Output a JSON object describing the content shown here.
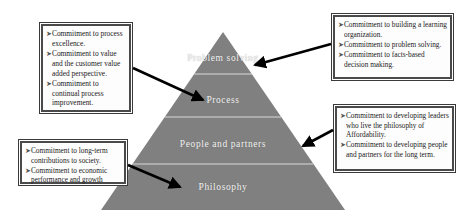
{
  "diagram": {
    "pyramid": {
      "fill_color": "#808080",
      "divider_color": "#d9d9d9",
      "label_color": "#f2f2f2",
      "tiers": [
        {
          "id": "problem-solving",
          "label": "Problem solving"
        },
        {
          "id": "process",
          "label": "Process"
        },
        {
          "id": "people-and-partners",
          "label": "People and partners"
        },
        {
          "id": "philosophy",
          "label": "Philosophy"
        }
      ]
    },
    "arrow_color": "#000000",
    "box_border_color": "#4a4a4a",
    "bullet_marker": "➤",
    "callouts": [
      {
        "id": "process-excellence",
        "target_tier": "process",
        "bullets": [
          "Commitment to process excellence.",
          "Commitment to value and the customer value added perspective.",
          "Commitment to continual process improvement."
        ]
      },
      {
        "id": "learning-organization",
        "target_tier": "problem-solving",
        "bullets": [
          "Commitment to building a learning organization.",
          "Commitment to problem solving.",
          "Commitment to facts-based decision making."
        ]
      },
      {
        "id": "society-contributions",
        "target_tier": "philosophy",
        "bullets": [
          "Commitment to long-term contributions to society.",
          "Commitment to economic performance and growth"
        ]
      },
      {
        "id": "developing-leaders",
        "target_tier": "people-and-partners",
        "bullets": [
          "Commitment to developing leaders who live the philosophy of Affordability.",
          "Commitment to developing people and partners for the long term."
        ]
      }
    ]
  }
}
